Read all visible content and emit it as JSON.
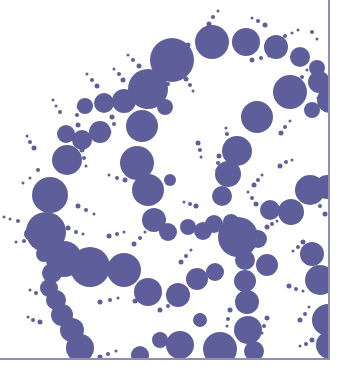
{
  "image": {
    "subject": "Fractal circle-packing pattern (Apollonian-like chains of circles)",
    "fill_color": "#5e5e9a",
    "background_color": "#ffffff",
    "frame_color": "#8f8fb5"
  },
  "circles": [
    [
      212,
      42,
      17
    ],
    [
      246,
      42,
      14
    ],
    [
      276,
      47,
      12
    ],
    [
      300,
      57,
      10
    ],
    [
      317,
      68,
      8
    ],
    [
      172,
      60,
      22
    ],
    [
      148,
      89,
      20
    ],
    [
      124,
      101,
      12
    ],
    [
      104,
      103,
      10
    ],
    [
      85,
      106,
      8
    ],
    [
      100,
      132,
      11
    ],
    [
      82,
      140,
      10
    ],
    [
      66,
      134,
      9
    ],
    [
      67,
      160,
      15
    ],
    [
      50,
      195,
      18
    ],
    [
      46,
      232,
      20
    ],
    [
      64,
      259,
      18
    ],
    [
      90,
      267,
      20
    ],
    [
      124,
      270,
      17
    ],
    [
      148,
      292,
      14
    ],
    [
      178,
      295,
      12
    ],
    [
      197,
      279,
      11
    ],
    [
      215,
      272,
      9
    ],
    [
      238,
      237,
      20
    ],
    [
      258,
      239,
      9
    ],
    [
      231,
      222,
      8
    ],
    [
      214,
      224,
      9
    ],
    [
      203,
      231,
      9
    ],
    [
      188,
      227,
      8
    ],
    [
      168,
      232,
      9
    ],
    [
      154,
      220,
      12
    ],
    [
      148,
      190,
      16
    ],
    [
      137,
      163,
      17
    ],
    [
      142,
      126,
      16
    ],
    [
      165,
      107,
      8
    ],
    [
      170,
      180,
      6
    ],
    [
      257,
      117,
      16
    ],
    [
      237,
      151,
      15
    ],
    [
      228,
      174,
      13
    ],
    [
      222,
      196,
      10
    ],
    [
      290,
      92,
      17
    ],
    [
      319,
      82,
      11
    ],
    [
      330,
      100,
      13
    ],
    [
      312,
      110,
      8
    ],
    [
      270,
      210,
      10
    ],
    [
      291,
      212,
      13
    ],
    [
      310,
      190,
      15
    ],
    [
      327,
      187,
      12
    ],
    [
      267,
      265,
      11
    ],
    [
      245,
      260,
      10
    ],
    [
      245,
      281,
      11
    ],
    [
      247,
      302,
      12
    ],
    [
      248,
      330,
      14
    ],
    [
      220,
      349,
      17
    ],
    [
      254,
      351,
      10
    ],
    [
      52,
      273,
      10
    ],
    [
      49,
      288,
      9
    ],
    [
      56,
      300,
      10
    ],
    [
      62,
      315,
      11
    ],
    [
      72,
      330,
      12
    ],
    [
      80,
      348,
      14
    ],
    [
      44,
      254,
      8
    ],
    [
      30,
      234,
      6
    ],
    [
      312,
      254,
      12
    ],
    [
      320,
      280,
      15
    ],
    [
      328,
      320,
      16
    ],
    [
      330,
      345,
      14
    ],
    [
      200,
      320,
      7
    ],
    [
      180,
      345,
      14
    ],
    [
      160,
      340,
      8
    ],
    [
      140,
      355,
      9
    ]
  ],
  "dots": [
    [
      209,
      24,
      2.5
    ],
    [
      213,
      17,
      2
    ],
    [
      218,
      11,
      1.5
    ],
    [
      188,
      45,
      2.5
    ],
    [
      181,
      48,
      2
    ],
    [
      175,
      50,
      1.5
    ],
    [
      252,
      60,
      2.5
    ],
    [
      261,
      58,
      2
    ],
    [
      269,
      56,
      1.5
    ],
    [
      265,
      25,
      2.5
    ],
    [
      258,
      21,
      2
    ],
    [
      252,
      18,
      1.5
    ],
    [
      285,
      36,
      2
    ],
    [
      292,
      33,
      1.5
    ],
    [
      298,
      30,
      1.5
    ],
    [
      312,
      32,
      2
    ],
    [
      317,
      39,
      1.5
    ],
    [
      302,
      77,
      2
    ],
    [
      307,
      70,
      1.5
    ],
    [
      318,
      98,
      1.5
    ],
    [
      326,
      92,
      1.5
    ],
    [
      186,
      79,
      2.5
    ],
    [
      190,
      85,
      2
    ],
    [
      193,
      91,
      1.5
    ],
    [
      168,
      84,
      2
    ],
    [
      164,
      92,
      1.5
    ],
    [
      139,
      66,
      2.5
    ],
    [
      133,
      60,
      2
    ],
    [
      128,
      55,
      1.5
    ],
    [
      123,
      80,
      2.5
    ],
    [
      119,
      74,
      2
    ],
    [
      114,
      69,
      1.5
    ],
    [
      112,
      117,
      2.5
    ],
    [
      114,
      124,
      2
    ],
    [
      110,
      132,
      1.5
    ],
    [
      97,
      86,
      2.5
    ],
    [
      92,
      80,
      2
    ],
    [
      87,
      74,
      1.5
    ],
    [
      78,
      125,
      2.5
    ],
    [
      77,
      115,
      2
    ],
    [
      78,
      107,
      1.5
    ],
    [
      60,
      112,
      2
    ],
    [
      56,
      106,
      1.5
    ],
    [
      53,
      100,
      1.5
    ],
    [
      82,
      150,
      2.5
    ],
    [
      84,
      158,
      2
    ],
    [
      86,
      166,
      1.5
    ],
    [
      34,
      148,
      2.5
    ],
    [
      30,
      142,
      2
    ],
    [
      27,
      136,
      1.5
    ],
    [
      78,
      206,
      2.5
    ],
    [
      86,
      210,
      2
    ],
    [
      94,
      214,
      1.5
    ],
    [
      38,
      170,
      2
    ],
    [
      30,
      178,
      1.5
    ],
    [
      23,
      183,
      1.5
    ],
    [
      18,
      221,
      2
    ],
    [
      10,
      219,
      1.5
    ],
    [
      4,
      217,
      1.5
    ],
    [
      68,
      228,
      2.5
    ],
    [
      76,
      232,
      2
    ],
    [
      83,
      234,
      1.5
    ],
    [
      32,
      240,
      2.5
    ],
    [
      24,
      241,
      2
    ],
    [
      16,
      242,
      1.5
    ],
    [
      109,
      236,
      2.5
    ],
    [
      117,
      234,
      2
    ],
    [
      124,
      232,
      1.5
    ],
    [
      134,
      244,
      2.5
    ],
    [
      140,
      238,
      2
    ],
    [
      145,
      232,
      1.5
    ],
    [
      100,
      302,
      2.5
    ],
    [
      110,
      300,
      2
    ],
    [
      118,
      298,
      1.5
    ],
    [
      135,
      301,
      2.5
    ],
    [
      143,
      298,
      2
    ],
    [
      150,
      294,
      1.5
    ],
    [
      160,
      310,
      2.5
    ],
    [
      168,
      306,
      2
    ],
    [
      174,
      302,
      1.5
    ],
    [
      198,
      143,
      2.5
    ],
    [
      200,
      150,
      2
    ],
    [
      201,
      157,
      1.5
    ],
    [
      125,
      180,
      2.5
    ],
    [
      117,
      178,
      2
    ],
    [
      109,
      175,
      1.5
    ],
    [
      181,
      262,
      2.5
    ],
    [
      186,
      256,
      2
    ],
    [
      191,
      250,
      1.5
    ],
    [
      254,
      185,
      2.5
    ],
    [
      258,
      180,
      2
    ],
    [
      262,
      175,
      1.5
    ],
    [
      281,
      133,
      2.5
    ],
    [
      285,
      127,
      2
    ],
    [
      290,
      121,
      1.5
    ],
    [
      280,
      166,
      2.5
    ],
    [
      286,
      162,
      2
    ],
    [
      292,
      160,
      1.5
    ],
    [
      228,
      142,
      2.5
    ],
    [
      227,
      134,
      2
    ],
    [
      226,
      128,
      1.5
    ],
    [
      219,
      156,
      2.5
    ],
    [
      218,
      163,
      2
    ],
    [
      217,
      170,
      1.5
    ],
    [
      267,
      227,
      2.5
    ],
    [
      272,
      224,
      2
    ],
    [
      277,
      221,
      1.5
    ],
    [
      256,
      204,
      2.5
    ],
    [
      252,
      198,
      2
    ],
    [
      248,
      192,
      1.5
    ],
    [
      303,
      242,
      2.5
    ],
    [
      298,
      247,
      2
    ],
    [
      293,
      251,
      1.5
    ],
    [
      325,
      214,
      2.5
    ],
    [
      320,
      206,
      2
    ],
    [
      316,
      198,
      1.5
    ],
    [
      289,
      286,
      2.5
    ],
    [
      296,
      289,
      2
    ],
    [
      303,
      291,
      1.5
    ],
    [
      230,
      310,
      2.5
    ],
    [
      228,
      319,
      2
    ],
    [
      227,
      326,
      1.5
    ],
    [
      267,
      318,
      2.5
    ],
    [
      264,
      326,
      2
    ],
    [
      262,
      333,
      1.5
    ],
    [
      300,
      320,
      2.5
    ],
    [
      305,
      314,
      2
    ],
    [
      309,
      307,
      1.5
    ],
    [
      312,
      340,
      2.5
    ],
    [
      306,
      344,
      2
    ],
    [
      300,
      346,
      1.5
    ],
    [
      100,
      357,
      2.5
    ],
    [
      108,
      354,
      2
    ],
    [
      116,
      351,
      1.5
    ],
    [
      40,
      322,
      2.5
    ],
    [
      33,
      320,
      2
    ],
    [
      28,
      317,
      1.5
    ],
    [
      36,
      293,
      2
    ],
    [
      30,
      290,
      1.5
    ],
    [
      196,
      206,
      2.5
    ],
    [
      190,
      204,
      2
    ],
    [
      184,
      202,
      1.5
    ]
  ]
}
